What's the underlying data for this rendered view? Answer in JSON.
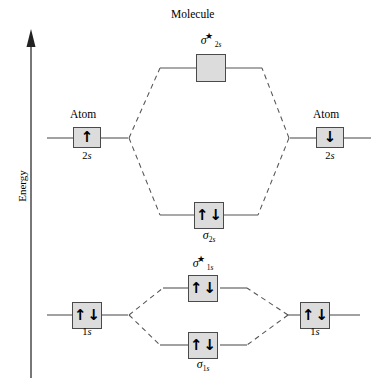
{
  "figure": {
    "type": "molecular-orbital-energy-diagram",
    "axis": {
      "label": "Energy",
      "direction": "up"
    },
    "headings": {
      "molecule": "Molecule",
      "atom_left": "Atom",
      "atom_right": "Atom"
    },
    "levels": {
      "atom_2s_left": {
        "caption": "2s",
        "caption_prefix": "2",
        "caption_italic": "s",
        "electrons": [
          "up"
        ]
      },
      "atom_2s_right": {
        "caption": "2s",
        "caption_prefix": "2",
        "caption_italic": "s",
        "electrons": [
          "down"
        ]
      },
      "sigma_2s_star": {
        "symbol": "σ",
        "subscript_number": "2",
        "subscript_letter": "s",
        "star": "★",
        "electrons": []
      },
      "sigma_2s": {
        "symbol": "σ",
        "subscript_number": "2",
        "subscript_letter": "s",
        "star": "",
        "electrons": [
          "up",
          "down"
        ]
      },
      "atom_1s_left": {
        "caption": "1s",
        "caption_prefix": "1",
        "caption_italic": "s",
        "electrons": [
          "up",
          "down"
        ]
      },
      "atom_1s_right": {
        "caption": "1s",
        "caption_prefix": "1",
        "caption_italic": "s",
        "electrons": [
          "up",
          "down"
        ]
      },
      "sigma_1s_star": {
        "symbol": "σ",
        "subscript_number": "1",
        "subscript_letter": "s",
        "star": "★",
        "electrons": [
          "up",
          "down"
        ]
      },
      "sigma_1s": {
        "symbol": "σ",
        "subscript_number": "1",
        "subscript_letter": "s",
        "star": "",
        "electrons": [
          "up",
          "down"
        ]
      }
    },
    "colors": {
      "box_fill": "#dcdcdc",
      "box_stroke": "#4a4a4a",
      "line": "#555555",
      "text": "#000000",
      "background": "#ffffff"
    }
  }
}
